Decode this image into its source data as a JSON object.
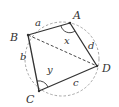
{
  "diagram": {
    "vertices": {
      "A": {
        "label": "A"
      },
      "B": {
        "label": "B"
      },
      "C": {
        "label": "C"
      },
      "D": {
        "label": "D"
      }
    },
    "sides": {
      "AB": {
        "label": "a"
      },
      "BC": {
        "label": "b"
      },
      "CD": {
        "label": "c"
      },
      "DA": {
        "label": "d"
      }
    },
    "diagonal": {
      "name": "BD",
      "style": "dashed"
    },
    "angles": {
      "A": {
        "label": "x"
      },
      "C": {
        "label": "y"
      }
    },
    "circle": {
      "style": "dashed"
    },
    "colors": {
      "line": "#333333",
      "circle": "#9a9a9a",
      "background": "#ffffff"
    }
  }
}
